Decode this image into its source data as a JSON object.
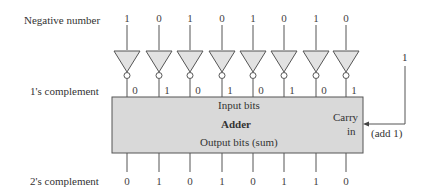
{
  "row_labels": {
    "negative": "Negative number",
    "ones": "1's complement",
    "twos": "2's complement"
  },
  "negative_bits": [
    "1",
    "0",
    "1",
    "0",
    "1",
    "0",
    "1",
    "0"
  ],
  "ones_complement_bits": [
    "0",
    "1",
    "0",
    "1",
    "0",
    "1",
    "0",
    "1"
  ],
  "twos_complement_bits": [
    "0",
    "1",
    "0",
    "1",
    "0",
    "1",
    "1",
    "0"
  ],
  "adder": {
    "title": "Adder",
    "input_label": "Input bits",
    "output_label": "Output bits (sum)",
    "carry_label_1": "Carry",
    "carry_label_2": "in"
  },
  "carry_input": {
    "value": "1",
    "note": "(add 1)"
  },
  "colors": {
    "gate_fill": "#e2e2e2",
    "box_fill": "#d9d9d9",
    "stroke": "#555555"
  }
}
